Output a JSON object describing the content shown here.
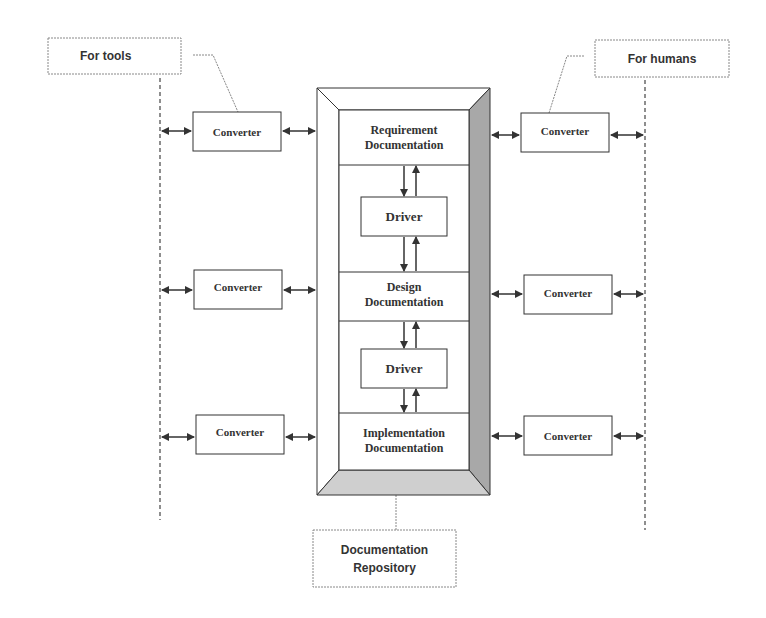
{
  "labels": {
    "for_tools": "For tools",
    "for_humans": "For humans",
    "repository": "Documentation Repository",
    "repository_line1": "Documentation",
    "repository_line2": "Repository"
  },
  "documents": [
    {
      "line1": "Requirement",
      "line2": "Documentation"
    },
    {
      "line1": "Design",
      "line2": "Documentation"
    },
    {
      "line1": "Implementation",
      "line2": "Documentation"
    }
  ],
  "drivers": [
    {
      "label": "Driver"
    },
    {
      "label": "Driver"
    }
  ],
  "converters_left": [
    {
      "label": "Converter"
    },
    {
      "label": "Converter"
    },
    {
      "label": "Converter"
    }
  ],
  "converters_right": [
    {
      "label": "Converter"
    },
    {
      "label": "Converter"
    },
    {
      "label": "Converter"
    }
  ],
  "colors": {
    "line": "#333333",
    "bevel_dark": "#a8a8a8",
    "bevel_mid": "#cfcfcf",
    "dashed": "#777777"
  }
}
